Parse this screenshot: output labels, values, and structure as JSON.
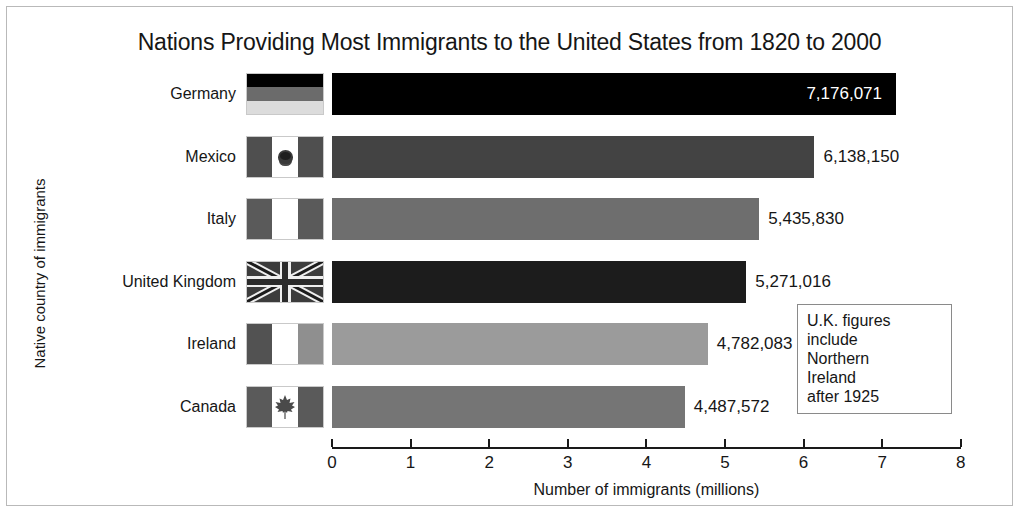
{
  "chart_data": {
    "type": "bar",
    "orientation": "horizontal",
    "title": "Nations Providing Most Immigrants to the United States from 1820 to 2000",
    "xlabel": "Number of immigrants (millions)",
    "ylabel": "Native country of immigrants",
    "xlim": [
      0,
      8
    ],
    "xticks": [
      "0",
      "1",
      "2",
      "3",
      "4",
      "5",
      "6",
      "7",
      "8"
    ],
    "grid": false,
    "legend": "none",
    "categories": [
      "Germany",
      "Mexico",
      "Italy",
      "United Kingdom",
      "Ireland",
      "Canada"
    ],
    "values": [
      7176071,
      6138150,
      5435830,
      5271016,
      4782083,
      4487572
    ],
    "value_labels": [
      "7,176,071",
      "6,138,150",
      "5,435,830",
      "5,271,016",
      "4,782,083",
      "4,487,572"
    ],
    "bars": [
      {
        "category": "Germany",
        "value": 7176071,
        "value_label": "7,176,071",
        "label_placement": "inside",
        "color": "#000000",
        "flag": "flag-germany"
      },
      {
        "category": "Mexico",
        "value": 6138150,
        "value_label": "6,138,150",
        "label_placement": "outside",
        "color": "#434343",
        "flag": "flag-mexico"
      },
      {
        "category": "Italy",
        "value": 5435830,
        "value_label": "5,435,830",
        "label_placement": "outside",
        "color": "#6e6e6e",
        "flag": "flag-italy"
      },
      {
        "category": "United Kingdom",
        "value": 5271016,
        "value_label": "5,271,016",
        "label_placement": "outside",
        "color": "#1c1c1c",
        "flag": "flag-united-kingdom"
      },
      {
        "category": "Ireland",
        "value": 4782083,
        "value_label": "4,782,083",
        "label_placement": "outside",
        "color": "#9b9b9b",
        "flag": "flag-ireland"
      },
      {
        "category": "Canada",
        "value": 4487572,
        "value_label": "4,487,572",
        "label_placement": "outside",
        "color": "#757575",
        "flag": "flag-canada"
      }
    ],
    "annotation": {
      "lines": [
        "U.K. figures",
        "include",
        "Northern",
        "Ireland",
        "after 1925"
      ]
    }
  },
  "colors": {
    "background": "#ffffff",
    "frame_border": "#b9b9b9",
    "axis": "#1a1a1a",
    "text": "#161616",
    "annotation_border": "#8a8a8a"
  }
}
